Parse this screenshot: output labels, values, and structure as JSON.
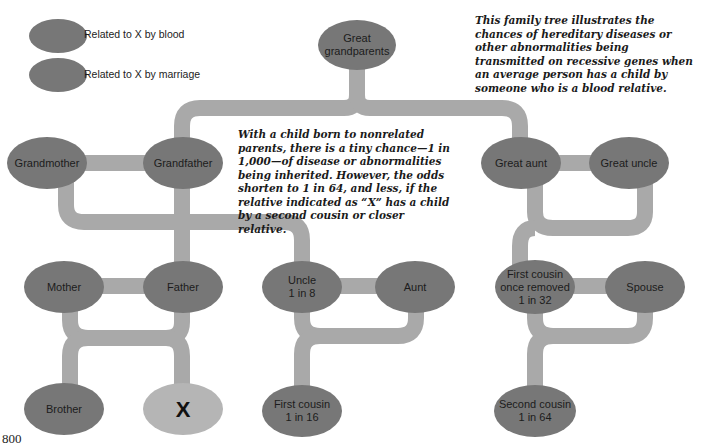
{
  "legend": {
    "items": [
      {
        "label": "Related to X by blood",
        "color": "#777777"
      },
      {
        "label": "Related to X by marriage",
        "color": "#777777"
      }
    ]
  },
  "captions": {
    "top_right": "This family tree illustrates the chances of hereditary diseases or other abnormalities being transmitted on recessive genes when an average person has a child by someone who is a blood relative.",
    "center": "With a child born to nonrelated parents, there is a tiny chance—1 in 1,000—of disease or abnormalities being inherited. However, the odds shorten to 1 in 64, and less, if the relative indicated as “X” has a child by a second cousin or closer relative."
  },
  "nodes": {
    "great_grandparents": {
      "label": "Great grandparents",
      "line1": "Great",
      "line2": "grandparents"
    },
    "grandmother": {
      "label": "Grandmother"
    },
    "grandfather": {
      "label": "Grandfather"
    },
    "great_aunt": {
      "label": "Great aunt"
    },
    "great_uncle": {
      "label": "Great uncle"
    },
    "mother": {
      "label": "Mother"
    },
    "father": {
      "label": "Father"
    },
    "uncle": {
      "line1": "Uncle",
      "line2": "1 in 8"
    },
    "aunt": {
      "label": "Aunt"
    },
    "first_cousin_once_removed": {
      "line1": "First cousin",
      "line2": "once removed",
      "line3": "1 in 32"
    },
    "spouse": {
      "label": "Spouse"
    },
    "brother": {
      "label": "Brother"
    },
    "x": {
      "label": "X"
    },
    "first_cousin": {
      "line1": "First cousin",
      "line2": "1 in 16"
    },
    "second_cousin": {
      "line1": "Second cousin",
      "line2": "1 in 64"
    }
  },
  "colors": {
    "node": "#777777",
    "connector": "#a9a9a9",
    "subject": "#b5b5b5"
  },
  "page_number": "800"
}
